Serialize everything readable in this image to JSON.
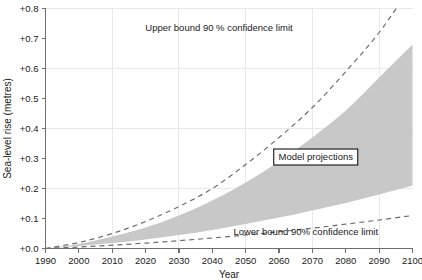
{
  "chart_data": {
    "type": "area",
    "title": "",
    "subtitle": "",
    "xlabel": "Year",
    "ylabel": "Sea-level rise (metres)",
    "xlim": [
      1990,
      2100
    ],
    "ylim": [
      0.0,
      0.8
    ],
    "grid": true,
    "grid_x_step": 20,
    "grid_y_step": 0.2,
    "x_tick_step": 10,
    "y_tick_step": 0.1,
    "legend_position": "inline-annotations",
    "x_tick_labels": [
      "1990",
      "2000",
      "2010",
      "2020",
      "2030",
      "2040",
      "2050",
      "2060",
      "2070",
      "2080",
      "2090",
      "2100"
    ],
    "y_tick_labels": [
      "+0.0",
      "+0.1",
      "+0.2",
      "+0.3",
      "+0.4",
      "+0.5",
      "+0.6",
      "+0.7",
      "+0.8"
    ],
    "x": [
      1990,
      2000,
      2010,
      2020,
      2030,
      2040,
      2050,
      2060,
      2070,
      2080,
      2090,
      2100
    ],
    "series": [
      {
        "name": "Upper bound 90 % confidence limit",
        "style": "dashed",
        "values": [
          0.0,
          0.02,
          0.05,
          0.09,
          0.14,
          0.2,
          0.28,
          0.37,
          0.47,
          0.59,
          0.72,
          0.88
        ]
      },
      {
        "name": "Model projections upper edge",
        "style": "band-top",
        "values": [
          0.0,
          0.015,
          0.04,
          0.07,
          0.11,
          0.16,
          0.22,
          0.29,
          0.37,
          0.46,
          0.57,
          0.68
        ]
      },
      {
        "name": "Model projections lower edge",
        "style": "band-bottom",
        "values": [
          0.0,
          0.008,
          0.018,
          0.03,
          0.045,
          0.062,
          0.082,
          0.103,
          0.127,
          0.152,
          0.18,
          0.21
        ]
      },
      {
        "name": "Lower bound 90% confidence limit",
        "style": "dashed",
        "values": [
          0.0,
          0.005,
          0.011,
          0.018,
          0.026,
          0.035,
          0.045,
          0.056,
          0.068,
          0.081,
          0.095,
          0.11
        ]
      }
    ],
    "annotations": [
      {
        "name": "upper-bound-label",
        "text": "Upper bound 90 %  confidence limit",
        "x": 2042,
        "y": 0.725
      },
      {
        "name": "model-projections-label",
        "text": "Model projections",
        "x": 2071,
        "y": 0.305,
        "boxed": true
      },
      {
        "name": "lower-bound-label",
        "text": "Lower bound 90%  confidence limit",
        "x": 2068,
        "y": 0.045
      }
    ],
    "colors": {
      "band_fill": "#c8c8c8",
      "bound_line": "#6e6e6e",
      "axis": "#6f6f6f",
      "grid": "#e9e9e9",
      "text": "#1a1a1a",
      "background": "#ffffff"
    }
  },
  "axes": {
    "y_title": "Sea-level rise (metres)",
    "x_title": "Year",
    "y_ticks": [
      "+0.8",
      "+0.7",
      "+0.6",
      "+0.5",
      "+0.4",
      "+0.3",
      "+0.2",
      "+0.1",
      "+0.0"
    ],
    "x_ticks": [
      "1990",
      "2000",
      "2010",
      "2020",
      "2030",
      "2040",
      "2050",
      "2060",
      "2070",
      "2080",
      "2090",
      "2100"
    ]
  },
  "labels": {
    "upper_bound": "Upper bound 90 %  confidence limit",
    "model_projections": "Model projections",
    "lower_bound": "Lower bound 90%  confidence limit"
  }
}
